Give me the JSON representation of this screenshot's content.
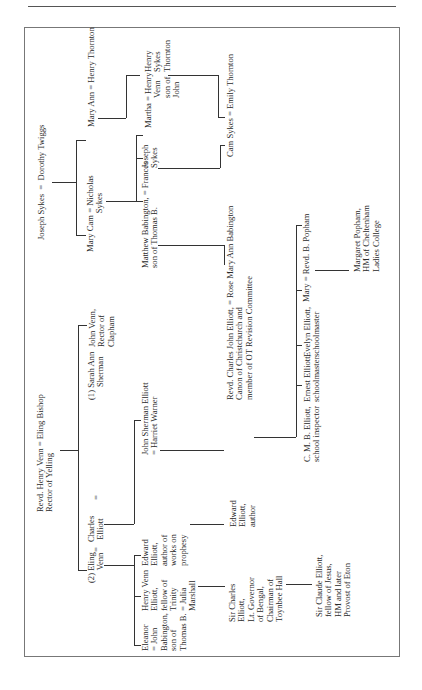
{
  "page": {
    "running_head": "THE BOOK",
    "figure_type": "family tree (rotated 90° counter-clockwise)"
  },
  "tree": {
    "sykes": {
      "root": "Joseph Sykes  =  Dorothy Twiggs",
      "mary_ann": "Mary Ann = Henry Thornton",
      "mary_cam": "Mary Cam = Nicholas\n                  Sykes",
      "henry_sykes_thornton": "Henry\nSykes\nThornton",
      "martha": "Martha = Henry\n              Venn\n              son of\n              John",
      "joseph_sykes_jr": "Joseph\nSykes",
      "matthew_babington": "Matthew Babington, = Frances\nson of Thomas B.",
      "cam_sykes": "Cam Sykes = Emily Thornton"
    },
    "venn": {
      "root": "Revd. Henry Venn = Eling Bishop\nRector of Yelling",
      "sarah_ann": "(1) Sarah Ann\n      Sherman",
      "john_venn": "John Venn,\nRector of\nClapham",
      "eling_venn": "(2) Eling\n      Venn",
      "charles_elliott": "Charles\n Elliott",
      "equals_1": "=",
      "equals_2": "=",
      "john_sherman_elliott": "John Sherman Elliott\n= Harriet Warner",
      "edward_elliott_prophesy": "Edward\nElliott,\nauthor of\nworks on\nprophesy",
      "henry_venn_elliott": "Henry Venn\nElliott,\nfellow of\nTrinity\n= Julia\nMarshall",
      "eleanor": "Eleanor\n= John\nBabington,\nson of\nThomas B."
    },
    "elliott": {
      "charles_john": "Revd. Charles John Elliott, = Rose Mary Ann Babington\nCanon of Christchurch and\nmember of OT Revision Committee",
      "edward_elliott_author": "Edward\nElliott,\nauthor",
      "sir_charles": "Sir Charles\nElliott,\nLt. Governor\nof Bengal,\nChairman of\nToynbee Hall",
      "sir_claude": "Sir Claude Elliott,\nfellow of Jesus,\nHM and later\nProvost of Eton",
      "cmb": "C. M. B. Elliott,\nschool inspector",
      "ernest": "Ernest Elliott,\nschoolmaster",
      "evelyn": "Evelyn Elliott,\nschoolmaster",
      "mary_popham": "Mary = Revd. B. Popham",
      "margaret_popham": "Margaret Popham,\nHM of Cheltenham\nLadies College"
    }
  }
}
